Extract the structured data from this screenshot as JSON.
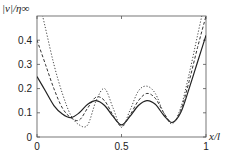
{
  "chart_data": {
    "type": "line",
    "title": "",
    "xlabel": "x/l",
    "ylabel": "|v|/η∞",
    "xlim": [
      0,
      1
    ],
    "ylim": [
      0,
      0.5
    ],
    "grid": false,
    "legend": "none",
    "x_ticks": [
      "0",
      "0.5",
      "1"
    ],
    "y_ticks": [
      "0",
      "0.1",
      "0.2",
      "0.3",
      "0.4"
    ],
    "x": [
      0,
      0.05,
      0.1,
      0.15,
      0.2,
      0.25,
      0.3,
      0.35,
      0.4,
      0.45,
      0.5,
      0.55,
      0.6,
      0.65,
      0.7,
      0.75,
      0.8,
      0.85,
      0.9,
      0.95,
      1.0
    ],
    "series": [
      {
        "name": "solid",
        "style": "solid",
        "values": [
          0.25,
          0.19,
          0.13,
          0.095,
          0.08,
          0.1,
          0.135,
          0.15,
          0.13,
          0.085,
          0.05,
          0.085,
          0.13,
          0.15,
          0.135,
          0.09,
          0.06,
          0.1,
          0.2,
          0.31,
          0.42
        ]
      },
      {
        "name": "dashed",
        "style": "dashed",
        "values": [
          0.4,
          0.3,
          0.2,
          0.12,
          0.08,
          0.07,
          0.12,
          0.165,
          0.15,
          0.09,
          0.045,
          0.09,
          0.15,
          0.18,
          0.16,
          0.1,
          0.06,
          0.11,
          0.23,
          0.37,
          0.5
        ]
      },
      {
        "name": "dotted",
        "style": "dotted",
        "values": [
          0.6,
          0.45,
          0.3,
          0.18,
          0.09,
          0.05,
          0.05,
          0.15,
          0.2,
          0.12,
          0.04,
          0.11,
          0.19,
          0.21,
          0.18,
          0.1,
          0.055,
          0.12,
          0.26,
          0.42,
          0.58
        ]
      }
    ]
  },
  "axes": {
    "ylabel": "|v|/η∞",
    "xlabel": "x/l"
  }
}
